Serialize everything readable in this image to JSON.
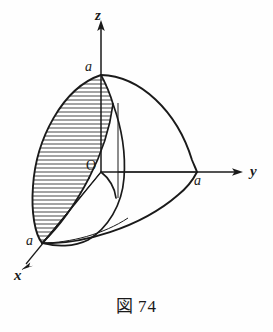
{
  "figure": {
    "caption_symbol": "図",
    "caption_number": "74",
    "caption_full": "図 74",
    "origin_label": "O",
    "axes": [
      {
        "id": "z",
        "label": "z",
        "direction": "up",
        "intercept_label": "a"
      },
      {
        "id": "y",
        "label": "y",
        "direction": "right",
        "intercept_label": "a"
      },
      {
        "id": "x",
        "label": "x",
        "direction": "down-left",
        "intercept_label": "a"
      }
    ],
    "intercepts": [
      {
        "axis": "z",
        "label": "a"
      },
      {
        "axis": "y",
        "label": "a"
      },
      {
        "axis": "x",
        "label": "a"
      }
    ],
    "colors": {
      "ink": "#1a1a1a",
      "background": "#fefefe",
      "hatch": "#262626"
    }
  }
}
